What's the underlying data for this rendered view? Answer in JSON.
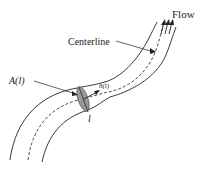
{
  "diagram": {
    "labels": {
      "flow": "Flow",
      "centerline": "Centerline",
      "area": "A(l)",
      "normal": "n̂(l)",
      "position": "l"
    },
    "colors": {
      "stroke": "#222222",
      "crossSection": "#9a9a9a",
      "background": "#ffffff"
    }
  }
}
